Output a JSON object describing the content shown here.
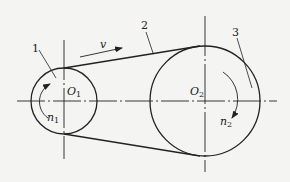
{
  "diagram": {
    "type": "belt-drive",
    "colors": {
      "stroke": "#222222",
      "background": "#f4f4f2"
    },
    "parts": [
      {
        "id": "1",
        "label": "1",
        "refers_to": "driving-pulley"
      },
      {
        "id": "2",
        "label": "2",
        "refers_to": "belt"
      },
      {
        "id": "3",
        "label": "3",
        "refers_to": "driven-pulley"
      }
    ],
    "small_pulley": {
      "center_label": "O",
      "center_sub": "1",
      "speed_label": "n",
      "speed_sub": "1"
    },
    "large_pulley": {
      "center_label": "O",
      "center_sub": "2",
      "speed_label": "n",
      "speed_sub": "2"
    },
    "belt": {
      "velocity_label": "v"
    }
  }
}
